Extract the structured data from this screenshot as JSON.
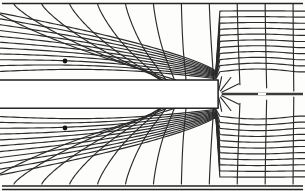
{
  "figure": {
    "type": "field-map",
    "width": 305,
    "height": 191,
    "background_color": "#fdfdfc",
    "line_color": "#2b2b2b",
    "frame_color": "#222222",
    "plate_fill": "#ffffff",
    "plate_hatch_color": "#3a3a3a",
    "dot_color": "#121212"
  },
  "frame": {
    "top_rule_y": 3.5,
    "bottom_rule_y": 186.0,
    "left_x": 2.0,
    "right_x": 303.0,
    "style": "horizontal-rules-only"
  },
  "plate": {
    "label": "hatched-plate",
    "left_x": 0,
    "right_x": 218,
    "top_y": 80,
    "bottom_y": 108,
    "mid_y": 94,
    "hatch_angle_deg": 45,
    "hatch_spacing": 7,
    "band_count": 2
  },
  "centerline": {
    "y": 94,
    "start_x": 222,
    "end_x": 303,
    "stroke_width": 2.6,
    "gap_start_x": 258,
    "gap_end_x": 266
  },
  "sources": [
    {
      "name": "upper-source-dot",
      "x": 65,
      "y": 61,
      "radius": 2.4
    },
    {
      "name": "lower-source-dot",
      "x": 65,
      "y": 128,
      "radius": 2.4
    }
  ],
  "chart_data": {
    "type": "line",
    "xlabel": "",
    "ylabel": "",
    "grid": false,
    "legend": "none",
    "xlim": [
      0,
      305
    ],
    "ylim": [
      0,
      191
    ],
    "series": [
      {
        "name": "equipotentials",
        "count": 13,
        "orientation": "quasi-vertical"
      },
      {
        "name": "flux-lines",
        "count": 11,
        "orientation": "quasi-horizontal"
      }
    ],
    "mirror_symmetry_axis_y": 94
  }
}
